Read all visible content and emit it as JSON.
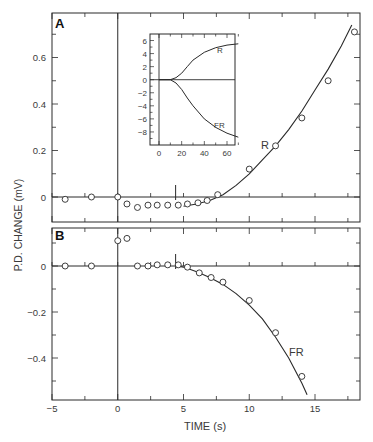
{
  "chart_data": [
    {
      "panel": "A",
      "type": "scatter",
      "title": "",
      "panel_label": "A",
      "xlabel": "TIME (s)",
      "ylabel": "P.D. CHANGE (mV)",
      "xlim": [
        -5,
        19
      ],
      "ylim": [
        -0.05,
        0.78
      ],
      "x_ticks": [
        -5,
        0,
        5,
        10,
        15
      ],
      "y_ticks": [
        0,
        0.2,
        0.4,
        0.6
      ],
      "y_tick_labels": [
        "0",
        "0.2",
        "0.4",
        "0.6"
      ],
      "curve_label": "R",
      "series": [
        {
          "name": "R data",
          "marker": "open-circle",
          "x": [
            -4,
            -2,
            0,
            0.7,
            1.5,
            2.3,
            3,
            3.8,
            4.6,
            5.3,
            6.1,
            6.8,
            7.6,
            10,
            12,
            14,
            16,
            18
          ],
          "y": [
            -0.01,
            0,
            0,
            -0.03,
            -0.045,
            -0.035,
            -0.035,
            -0.035,
            -0.035,
            -0.03,
            -0.025,
            -0.015,
            0.01,
            0.12,
            0.22,
            0.34,
            0.5,
            0.71
          ]
        },
        {
          "name": "R fit",
          "marker": "line",
          "x": [
            5,
            6,
            7,
            8,
            9,
            10,
            11,
            12,
            13,
            14,
            15,
            16,
            17,
            17.8
          ],
          "y": [
            -0.04,
            -0.03,
            -0.015,
            0.01,
            0.05,
            0.1,
            0.16,
            0.22,
            0.29,
            0.37,
            0.46,
            0.55,
            0.65,
            0.74
          ]
        }
      ],
      "annotations": [
        "stimulus onset vertical line at t=0",
        "short tick marker at t≈4.5"
      ],
      "inset": {
        "type": "line",
        "xlim": [
          0,
          75
        ],
        "ylim": [
          -10,
          7
        ],
        "x_ticks": [
          0,
          20,
          40,
          60
        ],
        "y_ticks": [
          6,
          4,
          2,
          0,
          -2,
          -4,
          -6,
          -8
        ],
        "series": [
          {
            "name": "R",
            "x": [
              0,
              10,
              15,
              20,
              25,
              30,
              40,
              50,
              60,
              70
            ],
            "y": [
              0,
              0,
              0.3,
              1.0,
              2.0,
              3.0,
              4.2,
              4.9,
              5.3,
              5.5
            ]
          },
          {
            "name": "FR",
            "x": [
              0,
              10,
              15,
              20,
              25,
              30,
              40,
              50,
              60,
              70
            ],
            "y": [
              0,
              0,
              -0.5,
              -1.5,
              -2.8,
              -4.0,
              -6.0,
              -7.3,
              -8.2,
              -8.8
            ]
          }
        ],
        "labels": [
          "R",
          "FR"
        ]
      },
      "grid": false
    },
    {
      "panel": "B",
      "type": "scatter",
      "title": "",
      "panel_label": "B",
      "xlabel": "TIME (s)",
      "ylabel": "P.D. CHANGE (mV)",
      "xlim": [
        -5,
        19
      ],
      "ylim": [
        -0.58,
        0.15
      ],
      "x_ticks": [
        -5,
        0,
        5,
        10,
        15
      ],
      "x_tick_labels": [
        "-5",
        "0",
        "5",
        "10",
        "15"
      ],
      "y_ticks": [
        0,
        -0.2,
        -0.4
      ],
      "y_tick_labels": [
        "0",
        "-0.2",
        "-0.4"
      ],
      "curve_label": "FR",
      "series": [
        {
          "name": "FR data",
          "marker": "open-circle",
          "x": [
            -4,
            -2,
            0,
            0.7,
            1.5,
            2.3,
            3,
            3.8,
            4.6,
            5.3,
            6.2,
            7.1,
            8,
            10,
            12,
            14
          ],
          "y": [
            0,
            0,
            0.11,
            0.12,
            0,
            0,
            0.005,
            0.005,
            0.005,
            -0.005,
            -0.03,
            -0.05,
            -0.07,
            -0.15,
            -0.29,
            -0.48
          ]
        },
        {
          "name": "FR fit",
          "marker": "line",
          "x": [
            4.5,
            5,
            6,
            7,
            8,
            9,
            10,
            11,
            12,
            13,
            14,
            14.4
          ],
          "y": [
            0,
            -0.005,
            -0.025,
            -0.05,
            -0.08,
            -0.12,
            -0.17,
            -0.23,
            -0.31,
            -0.4,
            -0.51,
            -0.56
          ]
        }
      ],
      "annotations": [
        "stimulus onset vertical line at t=0",
        "short tick marker at t≈4.5"
      ],
      "grid": false
    }
  ],
  "labels": {
    "panel_a": "A",
    "panel_b": "B",
    "xlabel": "TIME (s)",
    "ylabel": "P.D. CHANGE (mV)",
    "curve_r": "R",
    "curve_fr": "FR",
    "inset_r": "R",
    "inset_fr": "FR"
  }
}
